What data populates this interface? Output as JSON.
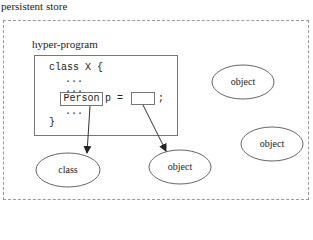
{
  "title": "persistent store",
  "hyper_program": {
    "label": "hyper-program",
    "code_lines": [
      "class X {",
      "...",
      "...",
      "...",
      "}"
    ],
    "person_type": "Person",
    "assign_text": "p =",
    "semicolon": ";"
  },
  "nodes": {
    "class_node": "class",
    "object_linked": "object",
    "object_top_right": "object",
    "object_right": "object"
  }
}
